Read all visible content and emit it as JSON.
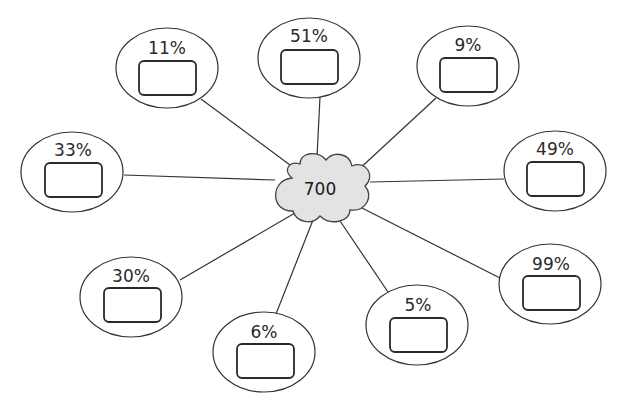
{
  "diagram": {
    "center": {
      "label": "700",
      "shape": "cloud",
      "fill": "#e3e3e3"
    },
    "nodes": [
      {
        "id": "n11",
        "label": "11%",
        "answer": ""
      },
      {
        "id": "n51",
        "label": "51%",
        "answer": ""
      },
      {
        "id": "n9",
        "label": "9%",
        "answer": ""
      },
      {
        "id": "n33",
        "label": "33%",
        "answer": ""
      },
      {
        "id": "n49",
        "label": "49%",
        "answer": ""
      },
      {
        "id": "n30",
        "label": "30%",
        "answer": ""
      },
      {
        "id": "n99",
        "label": "99%",
        "answer": ""
      },
      {
        "id": "n5",
        "label": "5%",
        "answer": ""
      },
      {
        "id": "n6",
        "label": "6%",
        "answer": ""
      }
    ]
  }
}
